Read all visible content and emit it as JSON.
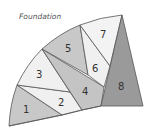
{
  "title": "Foundation",
  "pieces": [
    {
      "id": "1",
      "label": "1",
      "shade": "#c8c8c8"
    },
    {
      "id": "2",
      "label": "2",
      "shade": "#f0f0f0"
    },
    {
      "id": "3",
      "label": "3",
      "shade": "#f0f0f0"
    },
    {
      "id": "4",
      "label": "4",
      "shade": "#c4c4c4"
    },
    {
      "id": "5",
      "label": "5",
      "shade": "#c8c8c8"
    },
    {
      "id": "6",
      "label": "6",
      "shade": "#f0f0f0"
    },
    {
      "id": "7",
      "label": "7",
      "shade": "#f3f3f3"
    },
    {
      "id": "8",
      "label": "8",
      "shade": "#9a9a9a"
    }
  ],
  "colors": {
    "outline": "#555555",
    "text": "#333333"
  }
}
